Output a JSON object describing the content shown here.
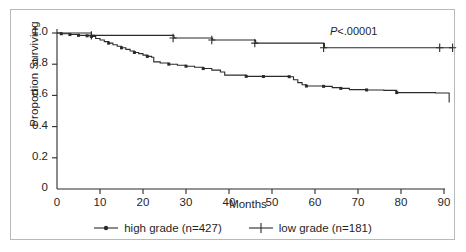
{
  "chart_data": {
    "type": "line",
    "chart_kind": "kaplan-meier-survival",
    "title": "",
    "xlabel": "Months",
    "ylabel": "Proportion Surviving",
    "xlim": [
      0,
      93
    ],
    "ylim": [
      0,
      1.05
    ],
    "xticks": [
      0,
      10,
      20,
      30,
      40,
      50,
      60,
      70,
      80,
      90
    ],
    "xticklabels": [
      "0",
      "10",
      "20",
      "30",
      "40",
      "50",
      "60",
      "70",
      "80",
      "90"
    ],
    "yticks": [
      0,
      0.2,
      0.4,
      0.6,
      0.8,
      1.0
    ],
    "yticklabels": [
      "0",
      "0.2",
      "0.4",
      "0.6",
      "0.8",
      "1.0"
    ],
    "grid": false,
    "legend_position": "below-axes",
    "annotations": [
      {
        "name": "p-value",
        "text": "P<.00001",
        "x": 78,
        "y": 0.985,
        "italic_prefix": "P"
      }
    ],
    "series": [
      {
        "name": "high grade (n=427)",
        "label": "high grade (n=427)",
        "n": 427,
        "color": "#2b2b2b",
        "marker": "dot",
        "legend_marker": "line-with-dot",
        "steps": [
          [
            0,
            1.0
          ],
          [
            1,
            0.995
          ],
          [
            3,
            0.99
          ],
          [
            5,
            0.985
          ],
          [
            7,
            0.982
          ],
          [
            8,
            0.978
          ],
          [
            9,
            0.965
          ],
          [
            10,
            0.955
          ],
          [
            11,
            0.945
          ],
          [
            12,
            0.935
          ],
          [
            13,
            0.925
          ],
          [
            14,
            0.915
          ],
          [
            15,
            0.905
          ],
          [
            16,
            0.895
          ],
          [
            17,
            0.885
          ],
          [
            18,
            0.875
          ],
          [
            19,
            0.868
          ],
          [
            20,
            0.858
          ],
          [
            21,
            0.85
          ],
          [
            22,
            0.845
          ],
          [
            22.5,
            0.815
          ],
          [
            24,
            0.808
          ],
          [
            26,
            0.8
          ],
          [
            28,
            0.793
          ],
          [
            30,
            0.787
          ],
          [
            32,
            0.78
          ],
          [
            34,
            0.772
          ],
          [
            36,
            0.762
          ],
          [
            38,
            0.75
          ],
          [
            39,
            0.73
          ],
          [
            44,
            0.722
          ],
          [
            54,
            0.72
          ],
          [
            55,
            0.7
          ],
          [
            56,
            0.682
          ],
          [
            57,
            0.668
          ],
          [
            58,
            0.66
          ],
          [
            62,
            0.658
          ],
          [
            64,
            0.65
          ],
          [
            66,
            0.645
          ],
          [
            68,
            0.637
          ],
          [
            72,
            0.635
          ],
          [
            76,
            0.632
          ],
          [
            79,
            0.618
          ],
          [
            88,
            0.615
          ],
          [
            91,
            0.615
          ],
          [
            91.2,
            0.555
          ]
        ],
        "censor_marks": [
          [
            1,
            0.995
          ],
          [
            3,
            0.99
          ],
          [
            5,
            0.985
          ],
          [
            7,
            0.982
          ],
          [
            8,
            0.978
          ],
          [
            12,
            0.935
          ],
          [
            15,
            0.905
          ],
          [
            18,
            0.875
          ],
          [
            21,
            0.85
          ],
          [
            26,
            0.8
          ],
          [
            30,
            0.787
          ],
          [
            34,
            0.772
          ],
          [
            44,
            0.722
          ],
          [
            48,
            0.721
          ],
          [
            54,
            0.72
          ],
          [
            58,
            0.66
          ],
          [
            62,
            0.658
          ],
          [
            66,
            0.645
          ],
          [
            72,
            0.635
          ],
          [
            79,
            0.618
          ]
        ]
      },
      {
        "name": "low grade (n=181)",
        "label": "low grade (n=181)",
        "n": 181,
        "color": "#2b2b2b",
        "marker": "plus",
        "legend_marker": "line-with-plus",
        "steps": [
          [
            0,
            1.0
          ],
          [
            7,
            1.0
          ],
          [
            8,
            0.985
          ],
          [
            27,
            0.983
          ],
          [
            27.2,
            0.968
          ],
          [
            36,
            0.966
          ],
          [
            36.2,
            0.955
          ],
          [
            46,
            0.953
          ],
          [
            46.2,
            0.935
          ],
          [
            62,
            0.933
          ],
          [
            62.2,
            0.905
          ],
          [
            89,
            0.905
          ],
          [
            92,
            0.905
          ]
        ],
        "censor_marks": [
          [
            8,
            0.985
          ],
          [
            27,
            0.968
          ],
          [
            36,
            0.955
          ],
          [
            46,
            0.935
          ],
          [
            62,
            0.905
          ],
          [
            89,
            0.905
          ],
          [
            92,
            0.905
          ]
        ]
      }
    ]
  },
  "legend": {
    "entries": [
      {
        "label": "high grade (n=427)",
        "marker": "dot"
      },
      {
        "label": "low grade (n=181)",
        "marker": "plus"
      }
    ]
  },
  "axes": {
    "x_title": "Months",
    "y_title": "Proportion Surviving"
  },
  "colors": {
    "axis": "#2b2b2b",
    "curve": "#2b2b2b",
    "frame": "#b9b9b9",
    "text": "#1f1f1f",
    "background": "#ffffff"
  }
}
